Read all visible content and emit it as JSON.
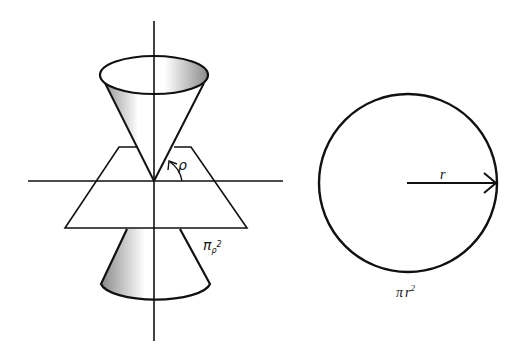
{
  "diagram": {
    "left_figure": {
      "description": "Double cone with vertex at origin cut by a plane",
      "angle_label": "ρ",
      "area_label_base": "π",
      "area_label_sub": "ρ",
      "area_label_sup": "2"
    },
    "right_figure": {
      "description": "Circle with radius arrow",
      "radius_label": "r",
      "area_label_base": "π",
      "area_label_var": "r",
      "area_label_sup": "2"
    },
    "colors": {
      "stroke": "#111111",
      "shade_dark": "#8a8a8a",
      "shade_light": "#ffffff",
      "background": "#ffffff"
    }
  }
}
